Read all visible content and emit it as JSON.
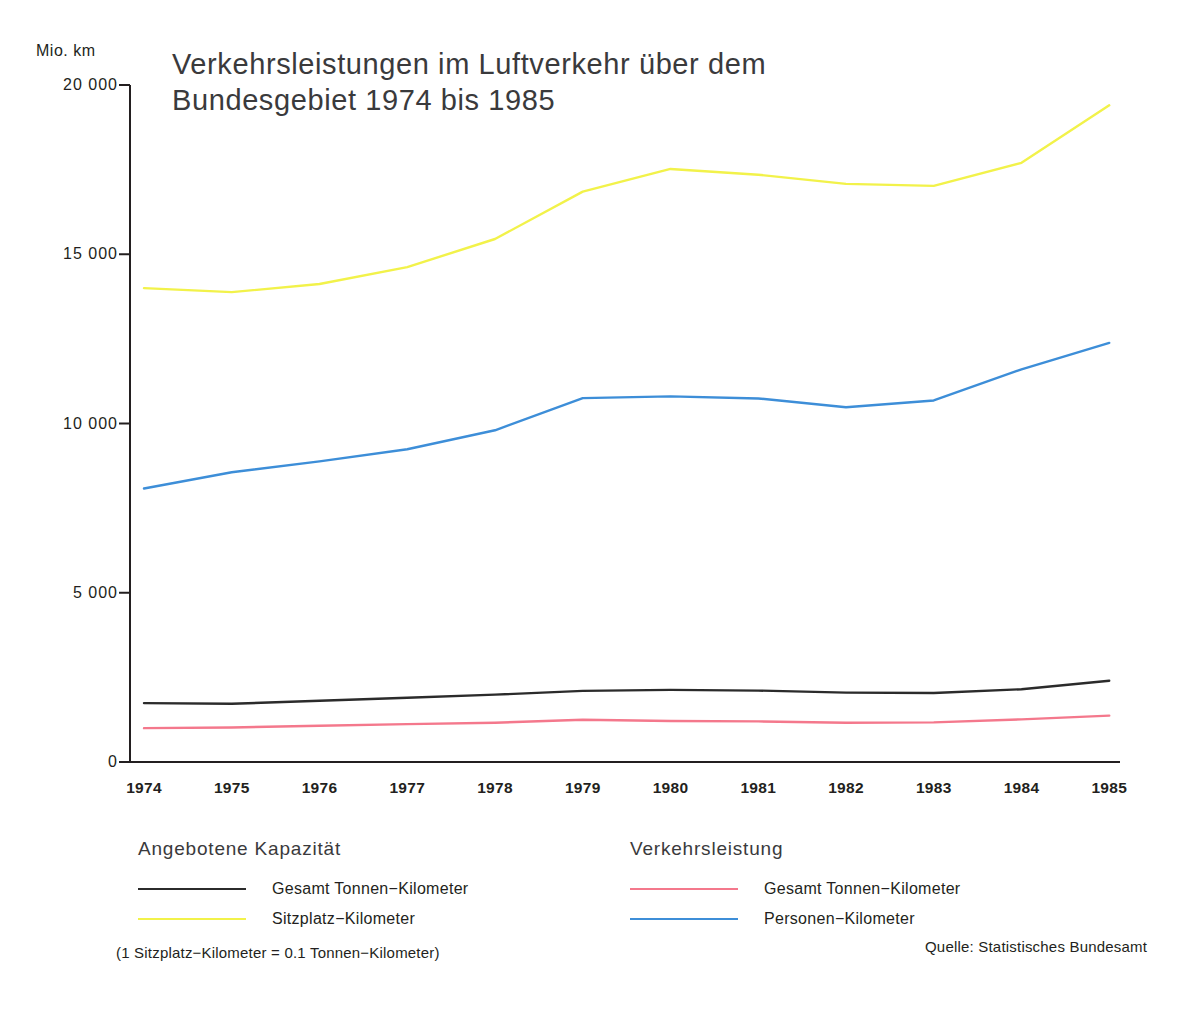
{
  "chart_data": {
    "type": "line",
    "title": "Verkehrsleistungen im Luftverkehr über dem\nBundesgebiet 1974 bis 1985",
    "ylabel": "Mio. km",
    "xlabel": "",
    "grid": false,
    "legend_position": "below-plot",
    "ylim": [
      0,
      20000
    ],
    "yticks": [
      0,
      5000,
      10000,
      15000,
      20000
    ],
    "ytick_labels": [
      "0",
      "5 000",
      "10 000",
      "15 000",
      "20 000"
    ],
    "categories": [
      "1974",
      "1975",
      "1976",
      "1977",
      "1978",
      "1979",
      "1980",
      "1981",
      "1982",
      "1983",
      "1984",
      "1985"
    ],
    "series": [
      {
        "name": "Sitzplatz-Kilometer",
        "group": "Angebotene Kapazität",
        "color": "#f2f24a",
        "values": [
          14000,
          13880,
          14120,
          14620,
          15450,
          16850,
          17520,
          17350,
          17080,
          17020,
          17700,
          19400
        ]
      },
      {
        "name": "Personen-Kilometer",
        "group": "Verkehrsleistung",
        "color": "#3d8ed8",
        "values": [
          8080,
          8560,
          8880,
          9240,
          9800,
          10750,
          10800,
          10740,
          10480,
          10680,
          11600,
          12380
        ]
      },
      {
        "name": "Gesamt Tonnen-Kilometer",
        "group": "Angebotene Kapazität",
        "color": "#2b2b2b",
        "values": [
          1740,
          1720,
          1810,
          1900,
          1990,
          2100,
          2130,
          2110,
          2050,
          2040,
          2150,
          2400
        ]
      },
      {
        "name": "Gesamt Tonnen-Kilometer",
        "group": "Verkehrsleistung",
        "color": "#f4788c",
        "values": [
          1000,
          1020,
          1070,
          1120,
          1160,
          1250,
          1210,
          1200,
          1160,
          1170,
          1260,
          1370
        ]
      }
    ],
    "annotations": {
      "footnote": "(1 Sitzplatz−Kilometer = 0.1 Tonnen−Kilometer)",
      "source": "Quelle: Statistisches Bundesamt"
    }
  },
  "legends": {
    "capacity": {
      "heading": "Angebotene Kapazität",
      "items": [
        {
          "label": "Gesamt Tonnen−Kilometer",
          "color": "#2b2b2b",
          "weight": "2.2px"
        },
        {
          "label": "Sitzplatz−Kilometer",
          "color": "#f2f24a",
          "weight": "2.2px"
        }
      ]
    },
    "performance": {
      "heading": "Verkehrsleistung",
      "items": [
        {
          "label": "Gesamt Tonnen−Kilometer",
          "color": "#f4788c",
          "weight": "2.2px"
        },
        {
          "label": "Personen−Kilometer",
          "color": "#3d8ed8",
          "weight": "2.2px"
        }
      ]
    }
  }
}
